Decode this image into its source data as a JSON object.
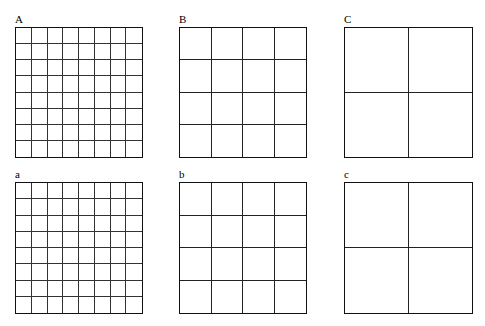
{
  "figure": {
    "panels": [
      {
        "id": "A",
        "letter": "A",
        "symbol": "N",
        "subscript": "1",
        "value": "=0.045 m/m",
        "superscript": "2",
        "grid_rows": 8,
        "grid_cols": 8,
        "x": 15,
        "y": 27,
        "w": 128,
        "h": 131
      },
      {
        "id": "B",
        "letter": "B",
        "symbol": "N",
        "subscript": "1",
        "value": "=0.025 m/m",
        "superscript": "2",
        "grid_rows": 4,
        "grid_cols": 4,
        "x": 179,
        "y": 27,
        "w": 128,
        "h": 131
      },
      {
        "id": "C",
        "letter": "C",
        "symbol": "N",
        "subscript": "1",
        "value": "=0.015 m/m",
        "superscript": "2",
        "grid_rows": 2,
        "grid_cols": 2,
        "x": 344,
        "y": 27,
        "w": 129,
        "h": 131
      },
      {
        "id": "a",
        "letter": "a",
        "symbol": "N",
        "subscript": "1",
        "value": "=0.045 m/m",
        "superscript": "2",
        "grid_rows": 8,
        "grid_cols": 8,
        "x": 15,
        "y": 182,
        "w": 128,
        "h": 132
      },
      {
        "id": "b",
        "letter": "b",
        "symbol": "N",
        "subscript": "1",
        "value": "=0.025 m/m",
        "superscript": "2",
        "grid_rows": 4,
        "grid_cols": 4,
        "x": 179,
        "y": 182,
        "w": 128,
        "h": 132
      },
      {
        "id": "c",
        "letter": "c",
        "symbol": "N",
        "subscript": "1",
        "value": "=0.015 m/m",
        "superscript": "2",
        "grid_rows": 2,
        "grid_cols": 2,
        "x": 344,
        "y": 182,
        "w": 129,
        "h": 132
      }
    ],
    "line_color": "#111111",
    "background": "#ffffff"
  }
}
